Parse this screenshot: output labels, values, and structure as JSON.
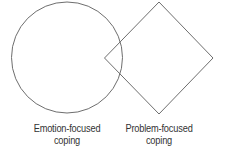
{
  "diagram": {
    "type": "overlap-shapes",
    "stroke_color": "#6e6e6e",
    "shapes": [
      {
        "id": "emotion",
        "shape": "circle",
        "label_line1": "Emotion-focused",
        "label_line2": "coping"
      },
      {
        "id": "problem",
        "shape": "diamond",
        "label_line1": "Problem-focused",
        "label_line2": "coping"
      }
    ]
  }
}
